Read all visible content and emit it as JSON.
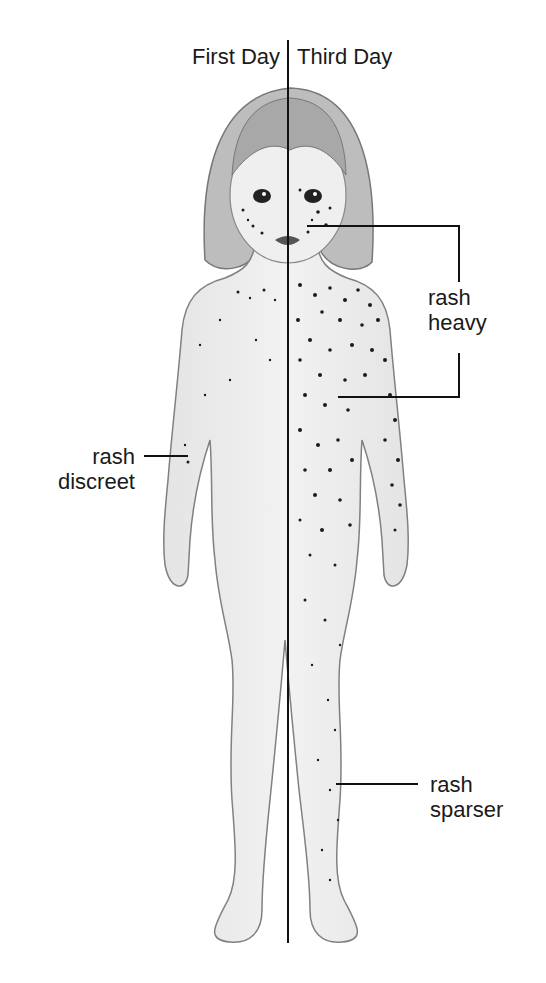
{
  "title": {
    "left": "First Day",
    "right": "Third Day"
  },
  "annotations": {
    "heavy": {
      "line1": "rash",
      "line2": "heavy"
    },
    "discreet": {
      "line1": "rash",
      "line2": "discreet"
    },
    "sparser": {
      "line1": "rash",
      "line2": "sparser"
    }
  },
  "figure": {
    "line_color": "#111111",
    "skin_color": "#eeeeee",
    "outline_color": "#777777",
    "spot_color": "#1a1a1a"
  }
}
